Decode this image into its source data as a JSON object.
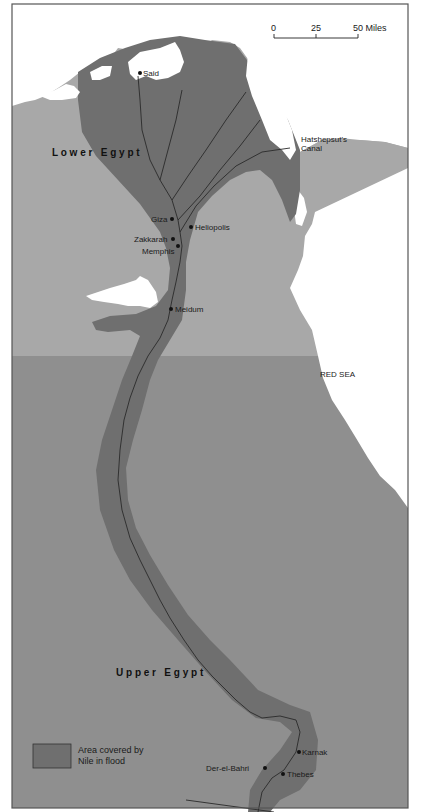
{
  "map": {
    "title_regions": {
      "lower": "L o w e r   E g y p t",
      "upper": "U p p e r   E g y p t"
    },
    "scale_bar": {
      "ticks": [
        "0",
        "25",
        "50 Miles"
      ],
      "unit": "Miles"
    },
    "sea_label": "RED SEA",
    "places": [
      {
        "name": "Said",
        "x": 140,
        "y": 73
      },
      {
        "name": "Giza",
        "x": 172,
        "y": 219
      },
      {
        "name": "Heliopolis",
        "x": 191,
        "y": 227
      },
      {
        "name": "Zakkarah",
        "x": 173,
        "y": 239
      },
      {
        "name": "Memphis",
        "x": 178,
        "y": 246
      },
      {
        "name": "Meidum",
        "x": 171,
        "y": 309
      },
      {
        "name": "Karnak",
        "x": 299,
        "y": 752
      },
      {
        "name": "Der-el-Bahri",
        "x": 265,
        "y": 768
      },
      {
        "name": "Thebes",
        "x": 283,
        "y": 774
      }
    ],
    "canal_label_line1": "Hatshepsut's",
    "canal_label_line2": "Canal",
    "legend": {
      "line1": "Area covered by",
      "line2": "Nile in flood"
    },
    "colors": {
      "sea": "#ffffff",
      "upper_land": "#a8a8a8",
      "lower_land": "#8f8f8f",
      "flood": "#6f6f6f",
      "river": "#2a2a2a",
      "frame": "#555555"
    }
  }
}
